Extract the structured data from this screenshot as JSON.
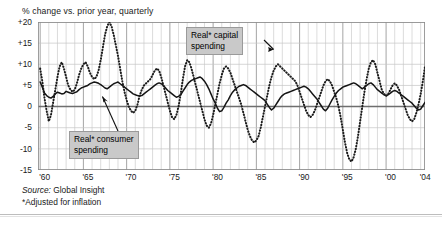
{
  "header": {
    "note": "% change vs. prior year, quarterly"
  },
  "footer": {
    "source_label": "Source:",
    "source_value": "Global Insight",
    "footnote": "*Adjusted for inflation"
  },
  "callouts": {
    "capital": {
      "line1": "Real* capital",
      "line2": "spending"
    },
    "consumer": {
      "line1": "Real* consumer",
      "line2": "spending"
    }
  },
  "colors": {
    "consumer_line": "#141414",
    "capital_line": "#1c1c1c",
    "grid_minor": "#c4c4c4",
    "grid_major": "#9b9b9b",
    "zero_line": "#6e6e6e",
    "callout_bg": "#c9c9c9",
    "frame": "#8c8c8c"
  },
  "chart_data": {
    "type": "line",
    "title": "",
    "subtitle": "% change vs. prior year, quarterly",
    "xlabel": "",
    "ylabel": "% change vs. prior year",
    "ylim": [
      -15,
      20
    ],
    "xlim": [
      1959.75,
      2004.5
    ],
    "grid": true,
    "grid_y_step": 5,
    "grid_x_step": 1,
    "grid_x_major_step": 5,
    "legend_position": "inline-callouts",
    "yticks": [
      20,
      15,
      10,
      5,
      0,
      -5,
      -10,
      -15
    ],
    "ytick_labels": [
      "+20",
      "+15",
      "+10",
      "+5",
      "0",
      "-5",
      "-10",
      "-15"
    ],
    "xticks": [
      1960,
      1965,
      1970,
      1975,
      1980,
      1985,
      1990,
      1995,
      2000,
      2004
    ],
    "xtick_labels": [
      "'60",
      "'65",
      "'70",
      "'75",
      "'80",
      "'85",
      "'90",
      "'95",
      "'00",
      "'04"
    ],
    "annotations": [
      {
        "text": "Real* capital spending",
        "target_x": 1987.0,
        "target_y": 14.0
      },
      {
        "text": "Real* consumer spending",
        "target_x": 1967.0,
        "target_y": 2.6
      }
    ],
    "series": [
      {
        "name": "Real* consumer spending",
        "style": "solid",
        "x_start": 1960.0,
        "x_step": 0.25,
        "values": [
          5.8,
          4.6,
          3.2,
          2.6,
          2.2,
          2.0,
          2.4,
          3.0,
          3.4,
          3.2,
          3.0,
          3.1,
          3.6,
          3.4,
          3.2,
          3.1,
          3.3,
          3.5,
          4.0,
          4.4,
          4.6,
          4.8,
          5.0,
          5.4,
          5.6,
          5.8,
          5.7,
          5.5,
          5.2,
          4.8,
          4.4,
          4.2,
          4.6,
          5.0,
          5.4,
          5.6,
          5.8,
          5.4,
          5.0,
          4.6,
          4.2,
          3.8,
          3.4,
          3.0,
          2.8,
          2.6,
          2.5,
          2.6,
          3.0,
          3.4,
          3.8,
          4.2,
          4.6,
          5.0,
          5.4,
          5.6,
          5.4,
          5.0,
          4.4,
          3.8,
          3.4,
          3.0,
          2.6,
          2.2,
          2.4,
          2.8,
          3.6,
          4.4,
          5.2,
          5.8,
          6.2,
          6.4,
          6.6,
          6.8,
          7.0,
          6.6,
          6.0,
          5.2,
          4.2,
          3.0,
          1.8,
          0.8,
          -0.4,
          -1.2,
          -1.0,
          -0.2,
          0.8,
          1.6,
          2.6,
          3.4,
          4.0,
          4.4,
          4.8,
          5.0,
          5.2,
          5.0,
          4.6,
          4.2,
          3.8,
          3.4,
          3.0,
          2.6,
          2.2,
          1.8,
          1.4,
          0.6,
          -0.2,
          -0.8,
          -0.4,
          0.4,
          1.2,
          2.0,
          2.6,
          3.0,
          3.2,
          3.4,
          3.6,
          3.8,
          4.0,
          4.2,
          4.4,
          4.6,
          4.8,
          4.6,
          4.2,
          3.6,
          3.0,
          2.4,
          1.8,
          1.0,
          0.2,
          -0.6,
          -1.0,
          -0.4,
          0.6,
          1.6,
          2.4,
          3.2,
          3.8,
          4.2,
          4.6,
          4.8,
          5.0,
          5.2,
          5.4,
          5.6,
          5.4,
          5.0,
          4.6,
          4.2,
          4.6,
          5.0,
          5.4,
          5.6,
          5.2,
          4.6,
          4.0,
          3.6,
          3.2,
          2.8,
          2.6,
          2.8,
          3.2,
          3.6,
          3.8,
          3.6,
          3.2,
          2.8,
          2.4,
          2.0,
          1.6,
          1.2,
          0.8,
          0.2,
          -0.4,
          -0.8,
          -0.6,
          0.2,
          1.0,
          1.6,
          2.2,
          2.6,
          3.0,
          3.2,
          3.4,
          3.2,
          3.0,
          2.8,
          2.6,
          2.8,
          3.0,
          3.2,
          3.4,
          3.2,
          3.0,
          2.8,
          2.6,
          2.8,
          3.2,
          3.6,
          3.8,
          3.6,
          3.4,
          3.2,
          3.4,
          3.6,
          3.8,
          4.0,
          4.2,
          4.4,
          4.6,
          4.8,
          4.6,
          4.4,
          4.6,
          4.8,
          5.0,
          4.8,
          4.4,
          4.2,
          4.4,
          4.6,
          4.8,
          5.0,
          4.8,
          4.4,
          4.0,
          3.6,
          3.2,
          3.0,
          2.8,
          2.6,
          2.6,
          2.8,
          3.0,
          3.2,
          3.4,
          3.2,
          3.0,
          2.8,
          2.6,
          2.6,
          2.8,
          3.0,
          3.2,
          3.4,
          3.6,
          3.8,
          3.6,
          3.4,
          3.2,
          3.4,
          3.6,
          3.8,
          3.6,
          3.4,
          3.2,
          3.4,
          3.6,
          3.8,
          3.6,
          3.4,
          3.6,
          3.8,
          3.6,
          3.4,
          3.2,
          3.0,
          3.2,
          3.4,
          3.6,
          3.8,
          3.6,
          3.4,
          3.2,
          3.4,
          3.6,
          3.4,
          3.2,
          3.4,
          3.6,
          3.8,
          3.6,
          3.4,
          3.2,
          3.4,
          3.6,
          3.8
        ]
      },
      {
        "name": "Real* capital spending",
        "style": "dotted",
        "x_start": 1960.0,
        "x_step": 0.25,
        "values": [
          9.0,
          6.0,
          2.0,
          -1.0,
          -3.5,
          -2.0,
          1.0,
          4.0,
          7.0,
          9.5,
          10.5,
          9.0,
          7.0,
          5.0,
          4.0,
          3.5,
          4.0,
          5.5,
          7.5,
          9.0,
          10.0,
          10.5,
          9.5,
          8.0,
          7.0,
          6.5,
          7.0,
          8.5,
          11.0,
          14.0,
          17.0,
          19.0,
          20.0,
          19.0,
          17.0,
          14.5,
          12.0,
          9.0,
          6.0,
          3.5,
          1.5,
          0.0,
          -1.0,
          -1.5,
          -1.0,
          0.5,
          2.5,
          4.0,
          5.0,
          5.5,
          6.0,
          6.5,
          7.5,
          8.5,
          9.0,
          8.5,
          7.0,
          5.0,
          3.0,
          1.0,
          -1.0,
          -2.5,
          -3.0,
          -2.0,
          0.0,
          3.0,
          6.5,
          9.5,
          11.0,
          10.5,
          9.0,
          7.0,
          5.0,
          3.0,
          1.0,
          -1.0,
          -3.0,
          -4.5,
          -5.0,
          -4.0,
          -2.0,
          0.5,
          3.0,
          5.5,
          7.5,
          9.0,
          9.5,
          9.0,
          8.0,
          6.5,
          5.0,
          3.5,
          2.0,
          0.5,
          -1.5,
          -3.5,
          -5.5,
          -7.0,
          -8.0,
          -8.5,
          -8.0,
          -7.0,
          -5.0,
          -2.5,
          0.0,
          2.5,
          5.0,
          7.0,
          8.5,
          9.5,
          10.0,
          9.5,
          9.0,
          8.5,
          8.0,
          7.5,
          7.0,
          6.5,
          6.0,
          5.0,
          3.5,
          2.0,
          0.5,
          -1.0,
          -2.0,
          -2.5,
          -2.0,
          -1.0,
          0.5,
          2.0,
          3.5,
          5.0,
          6.0,
          6.5,
          6.0,
          5.0,
          3.5,
          2.0,
          0.0,
          -2.5,
          -5.5,
          -8.5,
          -11.0,
          -12.5,
          -13.0,
          -12.0,
          -10.0,
          -7.0,
          -3.5,
          0.0,
          3.5,
          6.5,
          9.0,
          10.5,
          11.0,
          10.0,
          8.0,
          6.0,
          4.0,
          3.0,
          2.5,
          3.0,
          4.0,
          5.0,
          5.5,
          5.0,
          4.0,
          2.5,
          1.0,
          -0.5,
          -2.0,
          -3.0,
          -3.5,
          -3.0,
          -1.5,
          0.5,
          3.0,
          6.0,
          9.5,
          13.0,
          16.0,
          18.0,
          18.5,
          17.0,
          14.5,
          12.0,
          9.0,
          6.5,
          4.5,
          3.0,
          2.0,
          1.0,
          0.0,
          -1.0,
          -2.0,
          -3.0,
          -4.5,
          -6.0,
          -7.5,
          -8.5,
          -9.0,
          -8.5,
          -7.5,
          -6.0,
          -4.0,
          -2.0,
          -0.5,
          0.5,
          1.5,
          3.0,
          4.5,
          6.0,
          7.0,
          7.5,
          7.0,
          6.0,
          5.0,
          4.5,
          5.0,
          6.0,
          7.0,
          7.5,
          7.0,
          6.5,
          6.0,
          6.5,
          7.5,
          8.5,
          9.0,
          8.5,
          7.5,
          7.0,
          7.5,
          9.0,
          11.0,
          13.0,
          14.5,
          15.0,
          14.5,
          13.0,
          11.0,
          9.0,
          7.0,
          5.5,
          4.5,
          4.0,
          3.5,
          3.0,
          2.5,
          2.0,
          1.5,
          1.0,
          0.0,
          -1.5,
          -3.0,
          -4.5,
          -5.5,
          -6.0,
          -5.5,
          -4.5,
          -3.0,
          -1.5,
          0.0,
          1.5,
          2.5,
          3.0,
          3.5,
          4.0,
          4.5,
          4.5,
          4.0,
          3.5,
          3.0,
          3.5,
          4.0,
          4.5,
          5.0,
          5.0,
          4.5,
          4.0,
          4.0,
          4.5,
          5.0,
          5.5,
          5.5,
          5.0,
          4.5,
          4.5
        ]
      }
    ]
  }
}
